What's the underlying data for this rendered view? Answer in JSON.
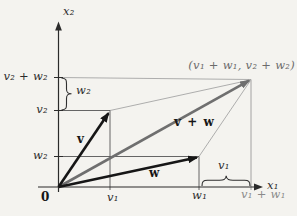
{
  "figure": {
    "colors": {
      "background": "#f4f3ef",
      "axis": "#2b2b2b",
      "vector": "#161616",
      "sum_vector": "#6f6f6f",
      "helper_dark": "#555555",
      "helper_light": "#a5a5a5",
      "muted_label": "#8a8a8a"
    },
    "labels": {
      "axis_x": "x₁",
      "axis_y": "x₂",
      "origin": "0",
      "tick_v2_plus_w2": "v₂ + w₂",
      "tick_v2": "v₂",
      "tick_w2": "w₂",
      "brace_w2": "w₂",
      "vector_v": "v",
      "vector_w": "w",
      "vector_sum": "v + w",
      "tick_v1": "v₁",
      "tick_w1": "w₁",
      "tick_v1_plus_w1": "v₁ + w₁",
      "brace_v1": "v₁",
      "sum_point": "(v₁ + w₁, v₂ + w₂)"
    }
  }
}
